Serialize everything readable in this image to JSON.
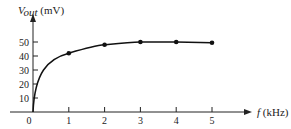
{
  "chart_data": {
    "type": "line",
    "title": "",
    "xlabel": "f (kHz)",
    "ylabel": "V_out (mV)",
    "x": [
      0,
      1,
      2,
      3,
      4,
      5
    ],
    "series": [
      {
        "name": "V_out",
        "values": [
          0,
          42,
          48,
          50,
          50,
          49.5
        ],
        "markers_at": [
          1,
          2,
          3,
          4,
          5
        ]
      }
    ],
    "xticks": [
      "0",
      "1",
      "2",
      "3",
      "4",
      "5"
    ],
    "yticks": [
      "10",
      "20",
      "30",
      "40",
      "50"
    ],
    "xlim": [
      0,
      6
    ],
    "ylim": [
      0,
      55
    ],
    "grid": false,
    "legend": "none"
  },
  "labels": {
    "y_axis_var": "V",
    "y_axis_sub": "out",
    "y_axis_unit": " (mV)",
    "x_axis_var": "f",
    "x_axis_unit": " (kHz)",
    "origin": "0"
  },
  "colors": {
    "line": "#111111",
    "axis": "#222222"
  }
}
